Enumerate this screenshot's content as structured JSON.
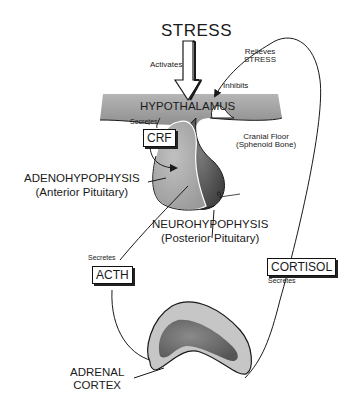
{
  "diagram": {
    "title": "STRESS",
    "labels": {
      "activates": "Activates",
      "relieves_line1": "Relieves",
      "relieves_line2": "STRESS",
      "inhibits": "Inhibits",
      "hypothalamus": "HYPOTHALAMUS",
      "secretes_crf": "Secretes",
      "cranial_line1": "Cranial Floor",
      "cranial_line2": "(Sphenoid Bone)",
      "adeno_line1": "ADENOHYPOPHYSIS",
      "adeno_line2": "(Anterior Pituitary)",
      "neuro_line1": "NEUROHYPOPHYSIS",
      "neuro_line2": "(Posterior Pituitary)",
      "secretes_acth": "Secretes",
      "secretes_cortisol": "Secretes",
      "adrenal_line1": "ADRENAL",
      "adrenal_line2": "CORTEX"
    },
    "boxes": {
      "crf": "CRF",
      "acth": "ACTH",
      "cortisol": "CORTISOL"
    },
    "colors": {
      "hypothalamus_fill": "#9a9a9a",
      "anterior_fill": "#a8a8a8",
      "posterior_fill": "#555555",
      "adrenal_outer": "#c4c4c4",
      "adrenal_inner": "#6e6e6e",
      "line": "#1a1a1a"
    }
  }
}
